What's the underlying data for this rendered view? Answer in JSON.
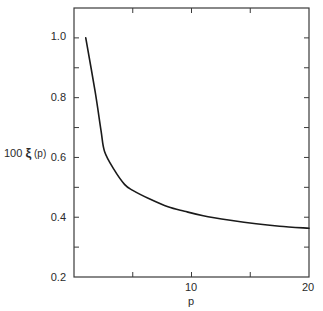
{
  "chart_data": {
    "type": "line",
    "title": "",
    "xlabel": "p",
    "ylabel": "100 ξ (p)",
    "xlim": [
      0,
      20
    ],
    "ylim": [
      0.2,
      1.1
    ],
    "grid": false,
    "legend": null,
    "x_ticks": [
      {
        "value": 0,
        "label": ""
      },
      {
        "value": 5,
        "label": ""
      },
      {
        "value": 10,
        "label": "10"
      },
      {
        "value": 15,
        "label": ""
      },
      {
        "value": 20,
        "label": "20"
      }
    ],
    "y_ticks": [
      {
        "value": 0.2,
        "label": "0.2"
      },
      {
        "value": 0.3,
        "label": ""
      },
      {
        "value": 0.4,
        "label": "0.4"
      },
      {
        "value": 0.5,
        "label": ""
      },
      {
        "value": 0.6,
        "label": "0.6"
      },
      {
        "value": 0.7,
        "label": ""
      },
      {
        "value": 0.8,
        "label": "0.8"
      },
      {
        "value": 0.9,
        "label": ""
      },
      {
        "value": 1.0,
        "label": "1.0"
      }
    ],
    "series": [
      {
        "name": "100 ξ (p)",
        "color": "#1a1a1a",
        "x": [
          1.0,
          1.8,
          2.3,
          2.6,
          3.4,
          4.3,
          5.0,
          6.5,
          8.0,
          9.4,
          11.0,
          13.3,
          15.5,
          17.5,
          20.0
        ],
        "y": [
          1.0,
          0.82,
          0.69,
          0.62,
          0.56,
          0.51,
          0.49,
          0.46,
          0.435,
          0.42,
          0.405,
          0.39,
          0.378,
          0.37,
          0.363
        ]
      }
    ]
  },
  "labels": {
    "xlabel": "p",
    "ylabel_prefix": "100 ",
    "ylabel_symbol": "ξ",
    "ylabel_suffix": " (p)",
    "x10": "10",
    "x20": "20",
    "y02": "0.2",
    "y04": "0.4",
    "y06": "0.6",
    "y08": "0.8",
    "y10": "1.0"
  }
}
